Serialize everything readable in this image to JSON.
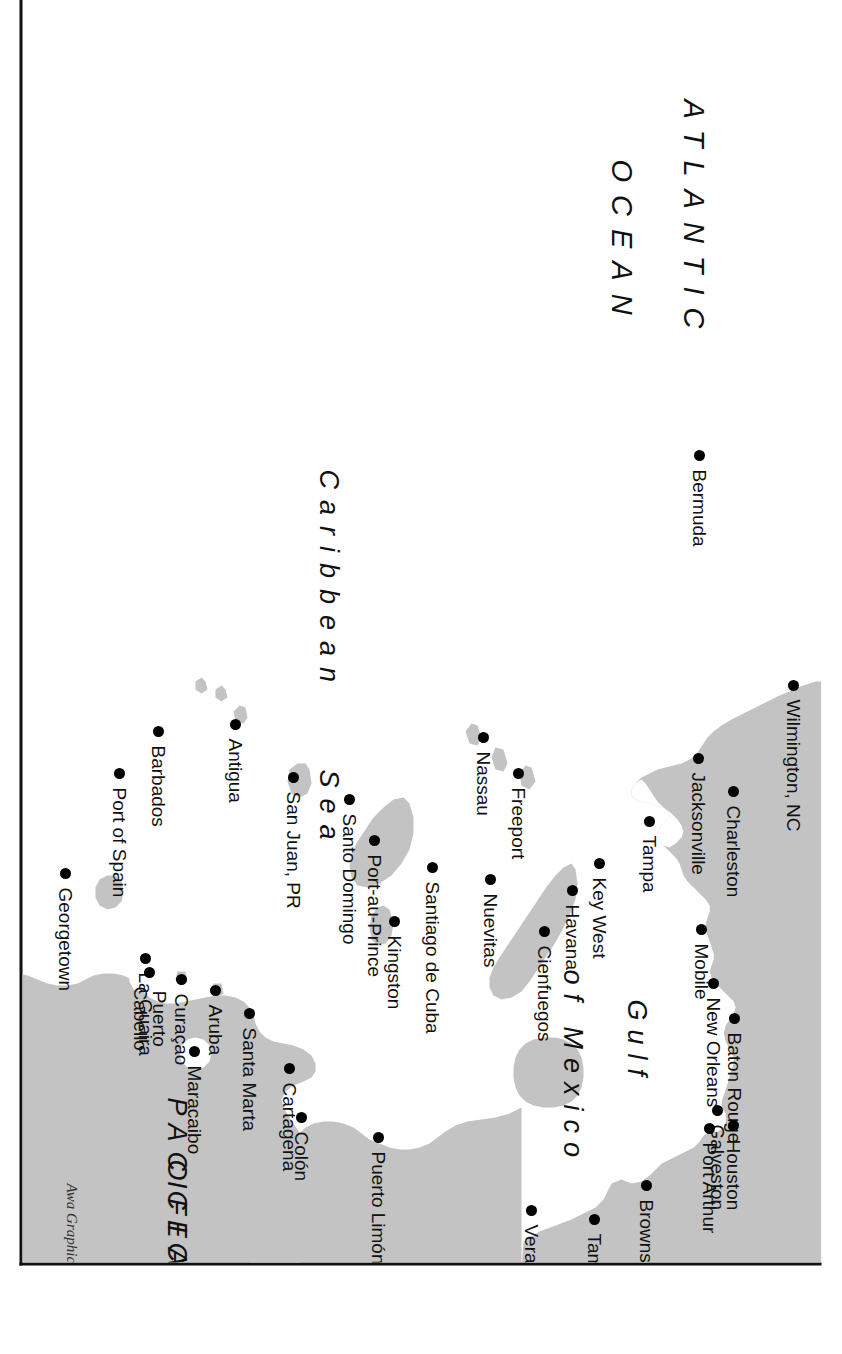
{
  "map": {
    "title": "Caribbean, Gulf of Mexico and Atlantic port map",
    "credit": "Awa Graphics",
    "colors": {
      "land": "#c3c3c3",
      "water": "#ffffff",
      "ink": "#111111",
      "dot": "#000000"
    },
    "border": {
      "color": "#111111",
      "width_px": 3
    },
    "orientation_note": "map content printed rotated 90 degrees clockwise on the page",
    "water_labels": [
      {
        "id": "atlantic",
        "line1": "ATLANTIC",
        "line2": "OCEAN"
      },
      {
        "id": "caribbean",
        "line1": "Caribbean",
        "line2": "Sea"
      },
      {
        "id": "gulf",
        "line1": "Gulf",
        "line2": "of Mexico"
      },
      {
        "id": "pacific",
        "line1": "PACIFIC",
        "line2": "OCEAN"
      }
    ],
    "cities": [
      {
        "name": "Wilmington, NC",
        "x": 702,
        "y": 28
      },
      {
        "name": "Charleston",
        "x": 808,
        "y": 88
      },
      {
        "name": "Jacksonville",
        "x": 775,
        "y": 123
      },
      {
        "name": "Tampa",
        "x": 838,
        "y": 172
      },
      {
        "name": "Mobile",
        "x": 946,
        "y": 120
      },
      {
        "name": "New Orleans",
        "x": 1000,
        "y": 108
      },
      {
        "name": "Baton Rouge",
        "x": 1035,
        "y": 87
      },
      {
        "name": "Galveston",
        "x": 1127,
        "y": 104
      },
      {
        "name": "Houston",
        "x": 1142,
        "y": 88
      },
      {
        "name": "Port Arthur",
        "x": 1145,
        "y": 112
      },
      {
        "name": "Brownsville",
        "x": 1202,
        "y": 175
      },
      {
        "name": "Tampico",
        "x": 1236,
        "y": 227
      },
      {
        "name": "Veracruz",
        "x": 1227,
        "y": 290
      },
      {
        "name": "Key West",
        "x": 880,
        "y": 222
      },
      {
        "name": "Havana",
        "x": 907,
        "y": 249
      },
      {
        "name": "Freeport",
        "x": 790,
        "y": 303
      },
      {
        "name": "Nassau",
        "x": 754,
        "y": 338
      },
      {
        "name": "Cienfuegos",
        "x": 948,
        "y": 277
      },
      {
        "name": "Nuevitas",
        "x": 896,
        "y": 331
      },
      {
        "name": "Santiago de Cuba",
        "x": 884,
        "y": 389
      },
      {
        "name": "Port-au-Prince",
        "x": 857,
        "y": 447
      },
      {
        "name": "Kingston",
        "x": 938,
        "y": 427
      },
      {
        "name": "Santo Domingo",
        "x": 816,
        "y": 472
      },
      {
        "name": "San Juan, PR",
        "x": 794,
        "y": 528
      },
      {
        "name": "Antigua",
        "x": 741,
        "y": 586
      },
      {
        "name": "Barbados",
        "x": 748,
        "y": 663
      },
      {
        "name": "Port of Spain",
        "x": 790,
        "y": 702
      },
      {
        "name": "Georgetown",
        "x": 890,
        "y": 756
      },
      {
        "name": "Aruba",
        "x": 1007,
        "y": 606
      },
      {
        "name": "Curaçao",
        "x": 996,
        "y": 640
      },
      {
        "name": "La Guaira",
        "x": 975,
        "y": 676
      },
      {
        "name": "Puerto Cabello",
        "x": 989,
        "y": 672
      },
      {
        "name": "Santa Marta",
        "x": 1030,
        "y": 572
      },
      {
        "name": "Maracaibo",
        "x": 1068,
        "y": 627
      },
      {
        "name": "Cartagena",
        "x": 1085,
        "y": 532
      },
      {
        "name": "Colón",
        "x": 1134,
        "y": 520
      },
      {
        "name": "Puerto Limón",
        "x": 1154,
        "y": 443
      }
    ]
  }
}
